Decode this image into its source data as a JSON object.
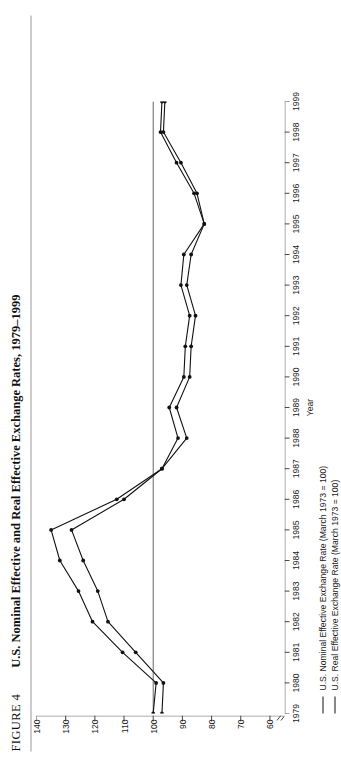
{
  "figure": {
    "number_label": "FIGURE 4",
    "title": "U.S. Nominal Effective and Real Effective Exchange Rates, 1979–1999"
  },
  "chart_data": {
    "type": "line",
    "title": "U.S. Nominal Effective and Real Effective Exchange Rates, 1979–1999",
    "xlabel": "Year",
    "ylabel": "",
    "x": [
      1979,
      1980,
      1981,
      1982,
      1983,
      1984,
      1985,
      1986,
      1987,
      1988,
      1989,
      1990,
      1991,
      1992,
      1993,
      1994,
      1995,
      1996,
      1997,
      1998,
      1999
    ],
    "xlim": [
      1979,
      1999
    ],
    "ylim": [
      55,
      140
    ],
    "yticks": [
      140,
      130,
      120,
      110,
      100,
      90,
      80,
      70,
      60
    ],
    "xticks": [
      1979,
      1980,
      1981,
      1982,
      1983,
      1984,
      1985,
      1986,
      1987,
      1988,
      1989,
      1990,
      1991,
      1992,
      1993,
      1994,
      1995,
      1996,
      1997,
      1998,
      1999
    ],
    "grid": false,
    "axis_break": true,
    "reference_line": 100,
    "legend_position": "below",
    "series": [
      {
        "name": "U.S. Nominal Effective Exchange Rate (March 1973 = 100)",
        "color": "#111111",
        "values": [
          100.0,
          99.0,
          110.5,
          120.8,
          125.6,
          132.0,
          135.0,
          112.5,
          97.0,
          88.5,
          92.0,
          87.5,
          87.0,
          85.5,
          88.5,
          87.0,
          82.5,
          86.0,
          92.0,
          97.5,
          97.0
        ]
      },
      {
        "name": "U.S. Real Effective Exchange Rate (March 1973 = 100)",
        "color": "#111111",
        "values": [
          97.0,
          96.5,
          106.0,
          115.5,
          119.0,
          124.0,
          128.0,
          110.0,
          97.0,
          91.5,
          94.5,
          89.5,
          89.0,
          87.5,
          90.5,
          89.5,
          82.5,
          85.0,
          90.5,
          96.5,
          96.0
        ]
      }
    ]
  },
  "xaxis": {
    "title": "Year",
    "ticks": [
      "1979",
      "1980",
      "1981",
      "1982",
      "1983",
      "1984",
      "1985",
      "1986",
      "1987",
      "1988",
      "1989",
      "1990",
      "1991",
      "1992",
      "1993",
      "1994",
      "1995",
      "1996",
      "1997",
      "1998",
      "1999"
    ]
  },
  "yaxis": {
    "ticks": [
      "140",
      "130",
      "120",
      "110",
      "100",
      "90",
      "80",
      "70",
      "60"
    ]
  },
  "legend": {
    "items": [
      {
        "label": "U.S. Nominal Effective Exchange Rate (March 1973 = 100)"
      },
      {
        "label": "U.S. Real Effective Exchange Rate (March 1973 = 100)"
      }
    ]
  }
}
